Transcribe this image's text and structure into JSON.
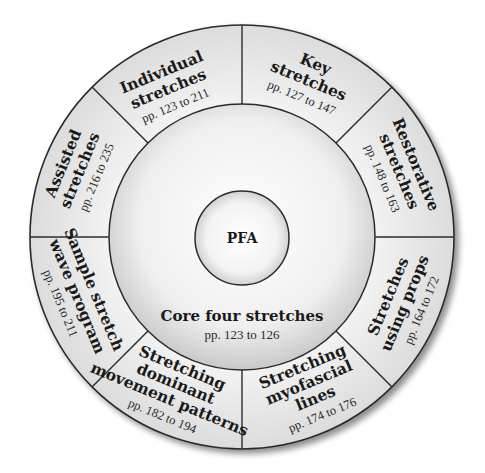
{
  "center": {
    "label": "PFA"
  },
  "core": {
    "title": "Core four stretches",
    "pages": "pp. 123 to 126"
  },
  "segments": [
    {
      "id": "individual",
      "title_lines": [
        "Individual",
        "stretches"
      ],
      "pages": "pp. 123 to 211"
    },
    {
      "id": "key",
      "title_lines": [
        "Key",
        "stretches"
      ],
      "pages": "pp. 127 to 147"
    },
    {
      "id": "restorative",
      "title_lines": [
        "Restorative",
        "stretches"
      ],
      "pages": "pp. 148 to 163"
    },
    {
      "id": "props",
      "title_lines": [
        "Stretches",
        "using props"
      ],
      "pages": "pp. 164 to 172"
    },
    {
      "id": "myofascial",
      "title_lines": [
        "Stretching",
        "myofascial",
        "lines"
      ],
      "pages": "pp. 174 to 176"
    },
    {
      "id": "dominant",
      "title_lines": [
        "Stretching",
        "dominant",
        "movement patterns"
      ],
      "pages": "pp. 182 to 194"
    },
    {
      "id": "sample",
      "title_lines": [
        "Sample stretch",
        "wave program"
      ],
      "pages": "pp. 195 to 211"
    },
    {
      "id": "assisted",
      "title_lines": [
        "Assisted",
        "stretches"
      ],
      "pages": "pp. 216 to 235"
    }
  ],
  "colors": {
    "ring_fill": "#e6e6e6",
    "stroke": "#2b2b2b",
    "core_fill": "#f2f2f2",
    "center_fill": "#f7f7f7"
  }
}
